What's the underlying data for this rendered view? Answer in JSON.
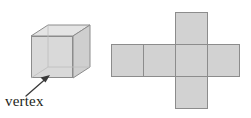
{
  "figure": {
    "background_color": "#ffffff",
    "labels": {
      "vertex": "vertex"
    },
    "colors": {
      "face_front": "#d9d9d9",
      "face_top": "#e4e4e4",
      "face_side": "#cfcfcf",
      "net_fill": "#d2d2d2",
      "outline": "#8c8c8c",
      "hidden_edge": "#b4b4b4",
      "arrow": "#3a3a3a",
      "text": "#231f20"
    },
    "cube": {
      "name": "cube-solid",
      "description": "three-dimensional cube drawn in oblique projection with visible top face, front face and right side face",
      "labeled_vertex": "front-bottom-left corner",
      "front_face": {
        "x": 31,
        "y": 36,
        "width": 42,
        "height": 42
      },
      "depth_offset": {
        "dx": 17,
        "dy": -11
      }
    },
    "net": {
      "name": "cube-net",
      "description": "cross-shaped net of a cube made of six square faces",
      "square_size": 32,
      "squares": [
        {
          "name": "net-square-top",
          "col": 1,
          "row": 0
        },
        {
          "name": "net-square-left",
          "col": -1,
          "row": 1
        },
        {
          "name": "net-square-middle-left",
          "col": 0,
          "row": 1
        },
        {
          "name": "net-square-center",
          "col": 1,
          "row": 1
        },
        {
          "name": "net-square-right",
          "col": 2,
          "row": 1
        },
        {
          "name": "net-square-bottom",
          "col": 1,
          "row": 2
        }
      ],
      "origin": {
        "x": 143,
        "y": 12
      },
      "face_count": 6
    },
    "arrow": {
      "name": "vertex-pointer-arrow",
      "from": {
        "x": 26,
        "y": 96
      },
      "to": {
        "x": 49,
        "y": 76
      }
    }
  }
}
